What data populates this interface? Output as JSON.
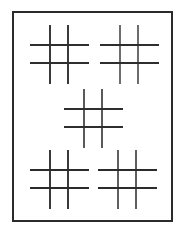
{
  "document": {
    "title": "Hash Grid Pattern",
    "description": "Five tic-tac-toe hash grids inside a rectangular frame",
    "background_color": "#ffffff"
  },
  "frame": {
    "name": "rectangular-border",
    "x": 12,
    "y": 11,
    "width": 161,
    "height": 211,
    "stroke_color": "#2b2b2b",
    "stroke_width": 2,
    "fill": "#ffffff"
  },
  "figures": [
    {
      "id": "hash-top-left",
      "label": "Top left hash grid",
      "x": 30,
      "y": 25,
      "size": 59,
      "vertical_positions": [
        20,
        38
      ],
      "horizontal_positions": [
        20,
        38
      ],
      "vertical_color": "#3a3a3a",
      "horizontal_color": "#2e2e2e",
      "vertical_width": 1.9,
      "horizontal_width": 1.7
    },
    {
      "id": "hash-top-right",
      "label": "Top right hash grid",
      "x": 100,
      "y": 25,
      "size": 59,
      "vertical_positions": [
        20,
        38
      ],
      "horizontal_positions": [
        20,
        38
      ],
      "vertical_color": "#6d6d6d",
      "horizontal_color": "#2e2e2e",
      "vertical_width": 1.7,
      "horizontal_width": 1.8
    },
    {
      "id": "hash-center",
      "label": "Center hash grid",
      "x": 64,
      "y": 89,
      "size": 59,
      "vertical_positions": [
        20,
        38
      ],
      "horizontal_positions": [
        20,
        38
      ],
      "vertical_color": "#5a5a5a",
      "horizontal_color": "#2e2e2e",
      "vertical_width": 1.8,
      "horizontal_width": 1.7
    },
    {
      "id": "hash-bottom-left",
      "label": "Bottom left hash grid",
      "x": 30,
      "y": 150,
      "size": 59,
      "vertical_positions": [
        20,
        38
      ],
      "horizontal_positions": [
        20,
        38
      ],
      "vertical_color": "#3a3a3a",
      "horizontal_color": "#2b2b2b",
      "vertical_width": 1.9,
      "horizontal_width": 1.8
    },
    {
      "id": "hash-bottom-right",
      "label": "Bottom right hash grid",
      "x": 98,
      "y": 150,
      "size": 59,
      "vertical_positions": [
        20,
        38
      ],
      "horizontal_positions": [
        20,
        38
      ],
      "vertical_color": "#5f5f5f",
      "horizontal_color": "#2b2b2b",
      "vertical_width": 1.7,
      "horizontal_width": 1.8
    }
  ]
}
